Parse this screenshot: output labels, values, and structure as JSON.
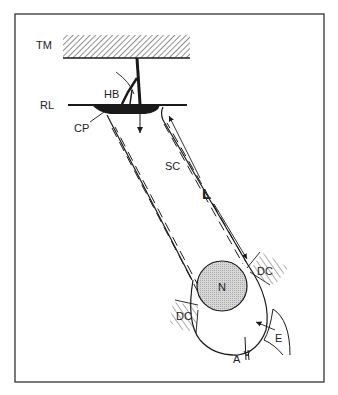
{
  "figure": {
    "type": "schematic diagram",
    "labels": {
      "tm": "TM",
      "rl": "RL",
      "hb": "HB",
      "cp": "CP",
      "sc": "SC",
      "l": "L",
      "n": "N",
      "dc_right": "DC",
      "dc_left": "DC",
      "e": "E",
      "a": "A"
    },
    "colors": {
      "line": "#1a1a1a",
      "nucleus_fill": "#c8c8c8",
      "frame": "#333333",
      "background": "#ffffff"
    }
  }
}
